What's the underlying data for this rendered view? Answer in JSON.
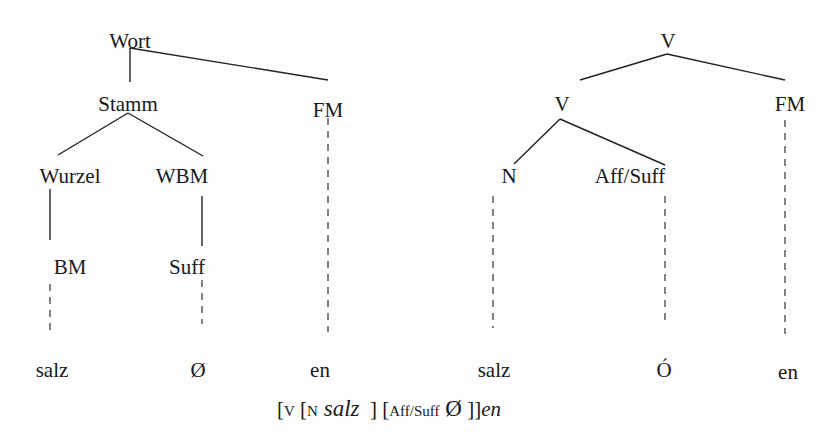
{
  "diagram": {
    "left_tree": {
      "root": "Wort",
      "level1": [
        "Stamm",
        "FM"
      ],
      "level2": [
        "Wurzel",
        "WBM"
      ],
      "level3": [
        "BM",
        "Suff"
      ],
      "terminals": [
        "salz",
        "Ø",
        "en"
      ]
    },
    "right_tree": {
      "root": "V",
      "level1": [
        "V",
        "FM"
      ],
      "level2": [
        "N",
        "Aff/Suff"
      ],
      "terminals": [
        "salz",
        "Ó",
        "en"
      ]
    },
    "formula": {
      "open_v": "[",
      "sub_v": "V",
      "open_n": " [",
      "sub_n": "N",
      "word": " salz",
      "close_n": "  ] [",
      "sub_aff": "Aff/Suff",
      "null": " Ø",
      "close_all": " ]]",
      "suffix": "en"
    }
  }
}
